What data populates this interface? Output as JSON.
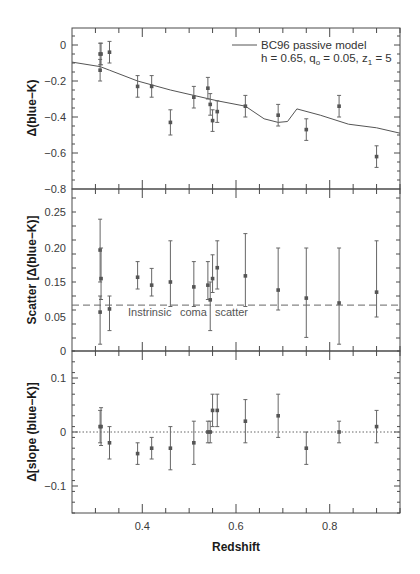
{
  "chart_data": {
    "type": "scatter",
    "layout": "three vertically stacked panels sharing x axis",
    "xlabel": "Redshift",
    "xlim": [
      0.25,
      0.95
    ],
    "x_ticks": [
      0.4,
      0.6,
      0.8
    ],
    "x_tick_labels": [
      "0.4",
      "0.6",
      "0.8"
    ],
    "x_minor_step": 0.05,
    "grid": false,
    "panels": [
      {
        "id": "color",
        "ylabel": "Δ(blue−K)",
        "ylim": [
          -0.8,
          0.1
        ],
        "y_ticks": [
          0,
          -0.2,
          -0.4,
          -0.6,
          -0.8
        ],
        "y_tick_labels": [
          "0",
          "-0.2",
          "-0.4",
          "-0.6",
          "-0.8"
        ],
        "points": {
          "x": [
            0.31,
            0.312,
            0.31,
            0.33,
            0.39,
            0.42,
            0.46,
            0.51,
            0.54,
            0.545,
            0.55,
            0.56,
            0.62,
            0.69,
            0.75,
            0.82,
            0.9
          ],
          "y": [
            -0.05,
            -0.05,
            -0.14,
            -0.04,
            -0.23,
            -0.23,
            -0.43,
            -0.29,
            -0.24,
            -0.33,
            -0.42,
            -0.37,
            -0.34,
            -0.39,
            -0.47,
            -0.34,
            -0.62
          ],
          "err": [
            0.06,
            0.06,
            0.06,
            0.06,
            0.06,
            0.06,
            0.07,
            0.06,
            0.06,
            0.06,
            0.06,
            0.06,
            0.06,
            0.06,
            0.06,
            0.06,
            0.06
          ]
        },
        "model_curve": {
          "name": "BC96 passive model",
          "x": [
            0.25,
            0.31,
            0.33,
            0.39,
            0.46,
            0.51,
            0.56,
            0.62,
            0.66,
            0.69,
            0.71,
            0.73,
            0.78,
            0.84,
            0.9,
            0.95
          ],
          "y": [
            -0.095,
            -0.12,
            -0.14,
            -0.2,
            -0.25,
            -0.28,
            -0.31,
            -0.34,
            -0.41,
            -0.43,
            -0.425,
            -0.355,
            -0.39,
            -0.44,
            -0.46,
            -0.49
          ]
        },
        "legend": {
          "position": "upper right",
          "line1": "BC96 passive model",
          "line2_prefix": "h = 0.65, q",
          "line2_sub1": "o",
          "line2_mid": " = 0.05, z",
          "line2_sub2": "1",
          "line2_suffix": " = 5"
        }
      },
      {
        "id": "scatter",
        "ylabel": "Scatter [Δ(blue−K)]",
        "y_tick_labels": [
          "0.25",
          "0.20",
          "0.15",
          "0.05",
          "0"
        ],
        "y_tick_values_as_printed": [
          0.25,
          0.2,
          0.15,
          0.05,
          0
        ],
        "points": {
          "x": [
            0.31,
            0.312,
            0.31,
            0.33,
            0.39,
            0.42,
            0.46,
            0.51,
            0.54,
            0.545,
            0.55,
            0.56,
            0.62,
            0.69,
            0.75,
            0.82,
            0.9
          ],
          "y": [
            0.197,
            0.155,
            0.064,
            0.073,
            0.157,
            0.141,
            0.15,
            0.136,
            0.141,
            0.099,
            0.155,
            0.171,
            0.159,
            0.127,
            0.104,
            0.09,
            0.121
          ],
          "lo": [
            0.15,
            0.1,
            0.01,
            0.03,
            0.13,
            0.11,
            0.08,
            0.08,
            0.1,
            0.03,
            0.12,
            0.13,
            0.08,
            0.07,
            0.02,
            0.01,
            0.05
          ],
          "hi": [
            0.24,
            0.2,
            0.11,
            0.11,
            0.18,
            0.17,
            0.21,
            0.18,
            0.18,
            0.15,
            0.19,
            0.21,
            0.22,
            0.2,
            0.2,
            0.2,
            0.21
          ]
        },
        "reference_line": {
          "y": 0.084,
          "style": "dashed",
          "label_words": [
            "Instrinsic",
            "coma",
            "scatter"
          ]
        }
      },
      {
        "id": "slope",
        "ylabel": "Δ[slope (blue−K)]",
        "ylim": [
          -0.15,
          0.15
        ],
        "y_ticks": [
          0.1,
          0,
          -0.1
        ],
        "y_tick_labels": [
          "0.1",
          "0",
          "-0.1"
        ],
        "points": {
          "x": [
            0.31,
            0.312,
            0.33,
            0.39,
            0.42,
            0.46,
            0.51,
            0.54,
            0.545,
            0.55,
            0.56,
            0.62,
            0.69,
            0.75,
            0.82,
            0.9
          ],
          "y": [
            0.01,
            0.01,
            -0.02,
            -0.04,
            -0.03,
            -0.03,
            -0.02,
            0.0,
            0.0,
            0.04,
            0.04,
            0.02,
            0.03,
            -0.03,
            0.0,
            0.01
          ],
          "err": [
            0.03,
            0.035,
            0.03,
            0.02,
            0.02,
            0.04,
            0.04,
            0.02,
            0.02,
            0.03,
            0.03,
            0.04,
            0.04,
            0.03,
            0.02,
            0.03
          ]
        },
        "reference_line": {
          "y": 0,
          "style": "dotted"
        }
      }
    ]
  }
}
